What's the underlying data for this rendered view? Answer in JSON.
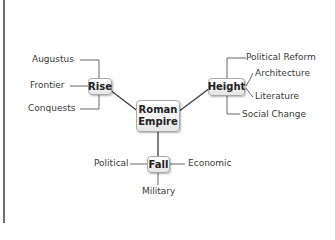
{
  "diagram": {
    "type": "mind-map",
    "central": {
      "label": "Roman Empire",
      "line1": "Roman",
      "line2": "Empire"
    },
    "branches": [
      {
        "label": "Rise",
        "children": [
          "Augustus",
          "Frontier",
          "Conquests"
        ]
      },
      {
        "label": "Height",
        "children": [
          "Political Reform",
          "Architecture",
          "Literature",
          "Social Change"
        ]
      },
      {
        "label": "Fall",
        "children": [
          "Political",
          "Economic",
          "Military"
        ]
      }
    ],
    "colors": {
      "line": "#3c3c3c",
      "node_border": "#a9a9a9",
      "frame": "#6e6e6e"
    }
  }
}
